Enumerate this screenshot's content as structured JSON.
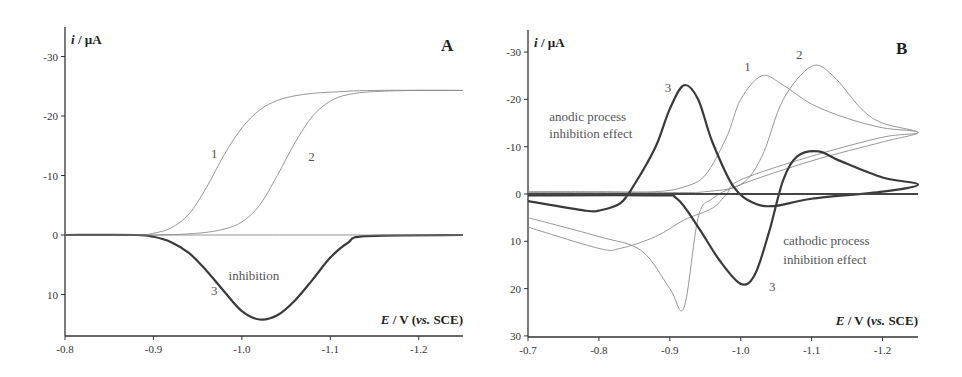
{
  "chart_data": [
    {
      "panel": "A",
      "type": "line",
      "panel_label": "A",
      "xlabel": "E / V (vs. SCE)",
      "ylabel": "i / µA",
      "xlim": [
        -0.8,
        -1.25
      ],
      "ylim": [
        15,
        -35
      ],
      "xticks": [
        -0.8,
        -0.9,
        -1.0,
        -1.1,
        -1.2
      ],
      "xtick_labels": [
        "-0.8",
        "-0.9",
        "-1.0",
        "-1.1",
        "-1.2"
      ],
      "yticks": [
        -30,
        -20,
        -10,
        0,
        10
      ],
      "ytick_labels": [
        "-30",
        "-20",
        "-10",
        "0",
        "10"
      ],
      "grid": false,
      "series": [
        {
          "name": "1",
          "style": "thin",
          "x": [
            -0.8,
            -0.88,
            -0.9,
            -0.92,
            -0.94,
            -0.96,
            -0.98,
            -1.0,
            -1.02,
            -1.04,
            -1.06,
            -1.08,
            -1.1,
            -1.15,
            -1.25
          ],
          "y": [
            0,
            0,
            -0.3,
            -1.2,
            -3.5,
            -8,
            -13.5,
            -18,
            -21,
            -22.6,
            -23.4,
            -23.8,
            -24.0,
            -24.3,
            -24.3
          ]
        },
        {
          "name": "2",
          "style": "thin",
          "x": [
            -0.8,
            -0.9,
            -0.95,
            -0.98,
            -1.0,
            -1.02,
            -1.04,
            -1.06,
            -1.08,
            -1.1,
            -1.12,
            -1.15,
            -1.2,
            -1.25
          ],
          "y": [
            0,
            0,
            -0.3,
            -1,
            -2.2,
            -5,
            -10,
            -15.5,
            -20,
            -22.5,
            -23.6,
            -24.1,
            -24.3,
            -24.3
          ]
        },
        {
          "name": "3",
          "style": "bold",
          "x": [
            -0.8,
            -0.88,
            -0.9,
            -0.92,
            -0.94,
            -0.96,
            -0.98,
            -1.0,
            -1.02,
            -1.04,
            -1.06,
            -1.08,
            -1.1,
            -1.12,
            -1.14,
            -1.25
          ],
          "y": [
            0,
            0,
            0.3,
            1.2,
            3,
            6,
            9.5,
            12.8,
            14.2,
            13.5,
            11,
            7.5,
            3.8,
            1.3,
            0.2,
            0
          ]
        },
        {
          "name": "baseline",
          "style": "thin",
          "x": [
            -0.8,
            -1.25
          ],
          "y": [
            0,
            0
          ]
        }
      ],
      "annotations": [
        {
          "text": "1",
          "x": -0.965,
          "y": -13
        },
        {
          "text": "2",
          "x": -1.075,
          "y": -12.5
        },
        {
          "text": "3",
          "x": -0.965,
          "y": 10
        },
        {
          "text": "inhibition",
          "x": -0.985,
          "y": 7.5
        }
      ]
    },
    {
      "panel": "B",
      "type": "line",
      "panel_label": "B",
      "xlabel": "E / V (vs. SCE)",
      "ylabel": "i / µA",
      "xlim": [
        -0.7,
        -1.25
      ],
      "ylim": [
        30,
        -35
      ],
      "xticks": [
        -0.7,
        -0.8,
        -0.9,
        -1.0,
        -1.1,
        -1.2
      ],
      "xtick_labels": [
        "-0.7",
        "-0.8",
        "-0.9",
        "-1.0",
        "-1.1",
        "-1.2"
      ],
      "yticks": [
        -30,
        -20,
        -10,
        0,
        10,
        20,
        30
      ],
      "ytick_labels": [
        "-30",
        "-20",
        "-10",
        "0",
        "10",
        "20",
        "30"
      ],
      "grid": false,
      "series": [
        {
          "name": "1",
          "style": "thin",
          "x": [
            -0.7,
            -0.8,
            -0.88,
            -0.92,
            -0.95,
            -0.98,
            -1.0,
            -1.03,
            -1.06,
            -1.1,
            -1.15,
            -1.2,
            -1.25,
            -1.2,
            -1.1,
            -1.0,
            -0.96,
            -0.94,
            -0.92,
            -0.9,
            -0.86,
            -0.8,
            -0.7
          ],
          "y": [
            -0.5,
            -0.5,
            -0.5,
            -1.5,
            -4,
            -12,
            -20,
            -25,
            -23,
            -19,
            -16,
            -14,
            -13,
            -11,
            -7,
            -2,
            1,
            5,
            24,
            20,
            12,
            9,
            5
          ]
        },
        {
          "name": "2",
          "style": "thin",
          "x": [
            -0.7,
            -0.9,
            -0.95,
            -1.0,
            -1.03,
            -1.06,
            -1.1,
            -1.13,
            -1.17,
            -1.2,
            -1.25,
            -1.2,
            -1.1,
            -1.0,
            -0.98,
            -0.96,
            -0.92,
            -0.88,
            -0.83,
            -0.8,
            -0.7
          ],
          "y": [
            -0.3,
            -0.3,
            -0.5,
            -2,
            -8,
            -20,
            -27,
            -25,
            -18,
            -15,
            -13,
            -12,
            -8,
            -3,
            0,
            3,
            5.5,
            9,
            11.5,
            11.5,
            7
          ]
        },
        {
          "name": "3",
          "style": "bold",
          "x": [
            -0.7,
            -0.78,
            -0.8,
            -0.83,
            -0.85,
            -0.88,
            -0.9,
            -0.92,
            -0.94,
            -0.96,
            -0.99,
            -1.02,
            -1.05,
            -1.1,
            -1.2,
            -1.25,
            -1.2,
            -1.14,
            -1.11,
            -1.08,
            -1.06,
            -1.04,
            -1.02,
            -1.0,
            -0.97,
            -0.94,
            -0.91,
            -0.88,
            -0.7
          ],
          "y": [
            1.5,
            3.5,
            3.5,
            2,
            -2,
            -10,
            -18,
            -23,
            -20,
            -11,
            -1.5,
            2,
            2.5,
            1,
            -0.5,
            -2,
            -3.5,
            -7,
            -9,
            -8,
            -3,
            8,
            17,
            19,
            14,
            7,
            1,
            0.3,
            0.3
          ]
        },
        {
          "name": "baseline",
          "style": "medium",
          "x": [
            -0.7,
            -1.25
          ],
          "y": [
            0,
            0
          ]
        }
      ],
      "annotations": [
        {
          "text": "1",
          "x": -1.005,
          "y": -26
        },
        {
          "text": "2",
          "x": -1.078,
          "y": -28.5
        },
        {
          "text": "3",
          "x": -0.893,
          "y": -21.5
        },
        {
          "text": "3",
          "x": -1.04,
          "y": 20.5
        },
        {
          "text": "anodic process",
          "x": -0.73,
          "y": -15.5
        },
        {
          "text": "inhibition  effect",
          "x": -0.73,
          "y": -11.8
        },
        {
          "text": "cathodic process",
          "x": -1.06,
          "y": 10.8
        },
        {
          "text": "inhibition effect",
          "x": -1.06,
          "y": 14.8
        }
      ]
    }
  ],
  "panels": [
    {
      "id": "A",
      "label": "A",
      "ylabel_i": "i",
      "ylabel_unit": " / µA",
      "xlabel_E": "E",
      "xlabel_mid": " / V (",
      "xlabel_vs": "vs.",
      "xlabel_end": " SCE)"
    },
    {
      "id": "B",
      "label": "B",
      "ylabel_i": "i",
      "ylabel_unit": " / µA",
      "xlabel_E": "E",
      "xlabel_mid": " / V (",
      "xlabel_vs": "vs.",
      "xlabel_end": " SCE)"
    }
  ],
  "colors": {
    "thin": "#8a8a8a",
    "bold": "#3a3a3a",
    "axis": "#333333",
    "medium": "#444444"
  }
}
